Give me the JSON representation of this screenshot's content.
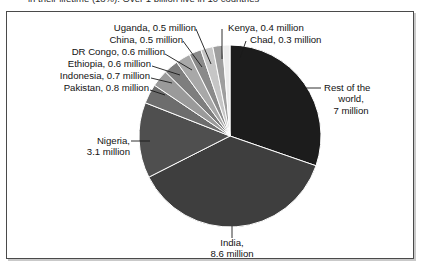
{
  "caption": {
    "text": "in their lifetime (18%). Over 1 billion live in 10 countries"
  },
  "chart_data": {
    "type": "pie",
    "title": "",
    "unit": "million",
    "total": 21.1,
    "legend_position": "callout-labels",
    "grid": false,
    "categories": [
      "Rest of the world",
      "India",
      "Nigeria",
      "Pakistan",
      "Indonesia",
      "Ethiopia",
      "DR Congo",
      "China",
      "Uganda",
      "Kenya",
      "Chad"
    ],
    "values": [
      7,
      8.6,
      3.1,
      0.8,
      0.7,
      0.6,
      0.6,
      0.5,
      0.5,
      0.4,
      0.3
    ],
    "labels": [
      "Rest of the world, 7 million",
      "India, 8.6 million",
      "Nigeria, 3.1 million",
      "Pakistan, 0.8 million",
      "Indonesia, 0.7 million",
      "Ethiopia, 0.6 million",
      "DR Congo, 0.6 million",
      "China, 0.5 million",
      "Uganda, 0.5 million",
      "Kenya, 0.4 million",
      "Chad, 0.3 million"
    ],
    "colors": [
      "#1c1c1c",
      "#3e3e3e",
      "#4f4f4f",
      "#6d6d6d",
      "#9a9a9a",
      "#7e7e7e",
      "#a8a8a8",
      "#8a8a8a",
      "#c6c6c6",
      "#9e9e9e",
      "#ececec"
    ]
  },
  "callouts": {
    "uganda": {
      "line1": "Uganda, 0.5 million"
    },
    "china": {
      "line1": "China, 0.5 million"
    },
    "drcongo": {
      "line1": "DR Congo, 0.6 million"
    },
    "ethiopia": {
      "line1": "Ethiopia, 0.6 million"
    },
    "indonesia": {
      "line1": "Indonesia, 0.7 million"
    },
    "pakistan": {
      "line1": "Pakistan, 0.8 million"
    },
    "kenya": {
      "line1": "Kenya, 0.4 million"
    },
    "chad": {
      "line1": "Chad, 0.3 million"
    },
    "nigeria": {
      "line1": "Nigeria,",
      "line2": "3.1 million"
    },
    "india": {
      "line1": "India,",
      "line2": "8.6 million"
    },
    "rest": {
      "line1": "Rest of the",
      "line2": "world,",
      "line3": "7 million"
    }
  }
}
